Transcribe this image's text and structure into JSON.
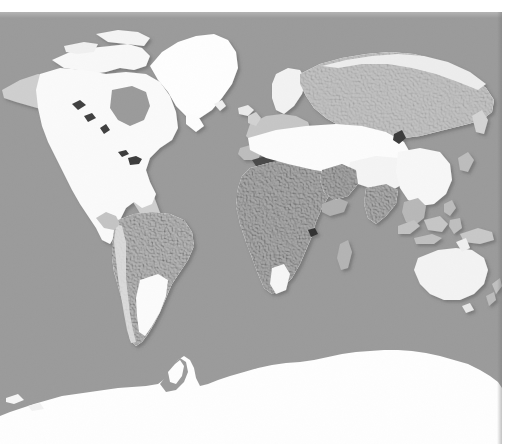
{
  "page": {
    "width": 517,
    "height": 444,
    "background_color": "#ffffff"
  },
  "map": {
    "name": "world-relief-map",
    "projection": "mercator-like equirectangular",
    "description": "Grayscale shaded-relief world map showing continents with snow and ice cover rendered in white over gray terrain on a gray ocean background.",
    "plate": {
      "x": 0,
      "y": 12,
      "width": 502,
      "height": 432
    },
    "colors": {
      "ocean": "#9b9b9b",
      "land_base": "#a8a8a8",
      "land_highlight": "#c8c8c8",
      "snow_ice": "#fdfdfd",
      "snow_ice_soft": "#f2f2f2",
      "relief_shadow": "#6e6e6e",
      "lake_dark": "#3a3a3a",
      "page_background": "#ffffff",
      "drop_shadow": "rgba(0,0,0,0.28)"
    },
    "legend_present": false,
    "labels_present": false,
    "graticule_present": false,
    "features": [
      {
        "id": "greenland",
        "label": "Greenland",
        "fill": "snow_ice"
      },
      {
        "id": "north-america",
        "label": "North America",
        "fill": "snow_ice"
      },
      {
        "id": "canadian-arctic",
        "label": "Canadian Arctic Islands",
        "fill": "snow_ice"
      },
      {
        "id": "alaska",
        "label": "Alaska",
        "fill": "snow_ice"
      },
      {
        "id": "south-america",
        "label": "South America",
        "fill": "land_base"
      },
      {
        "id": "patagonia",
        "label": "Patagonia",
        "fill": "snow_ice"
      },
      {
        "id": "africa",
        "label": "Africa",
        "fill": "land_base"
      },
      {
        "id": "europe",
        "label": "Europe",
        "fill": "land_highlight"
      },
      {
        "id": "scandinavia",
        "label": "Scandinavia",
        "fill": "snow_ice"
      },
      {
        "id": "central-asia",
        "label": "Central Asia snow belt",
        "fill": "snow_ice"
      },
      {
        "id": "siberia",
        "label": "Siberia",
        "fill": "land_highlight"
      },
      {
        "id": "himalaya-tibet",
        "label": "Tibetan Plateau",
        "fill": "snow_ice"
      },
      {
        "id": "china-east",
        "label": "East Asia",
        "fill": "snow_ice"
      },
      {
        "id": "india",
        "label": "Indian Subcontinent",
        "fill": "land_base"
      },
      {
        "id": "southeast-asia",
        "label": "Southeast Asia",
        "fill": "land_base"
      },
      {
        "id": "australia",
        "label": "Australia",
        "fill": "snow_ice_soft"
      },
      {
        "id": "new-zealand",
        "label": "New Zealand",
        "fill": "land_base"
      },
      {
        "id": "antarctica",
        "label": "Antarctica",
        "fill": "snow_ice"
      },
      {
        "id": "iceland",
        "label": "Iceland",
        "fill": "snow_ice"
      },
      {
        "id": "madagascar",
        "label": "Madagascar",
        "fill": "land_base"
      },
      {
        "id": "japan",
        "label": "Japan",
        "fill": "land_base"
      },
      {
        "id": "great-lakes",
        "label": "Great Lakes",
        "fill": "lake_dark"
      },
      {
        "id": "hudson-bay",
        "label": "Hudson Bay",
        "fill": "ocean"
      },
      {
        "id": "caspian-sea",
        "label": "Caspian Sea",
        "fill": "lake_dark"
      },
      {
        "id": "black-sea",
        "label": "Black Sea",
        "fill": "lake_dark"
      },
      {
        "id": "mediterranean",
        "label": "Mediterranean Sea",
        "fill": "lake_dark"
      },
      {
        "id": "lake-baikal",
        "label": "Lake Baikal",
        "fill": "lake_dark"
      },
      {
        "id": "lake-victoria",
        "label": "Lake Victoria",
        "fill": "lake_dark"
      }
    ]
  }
}
